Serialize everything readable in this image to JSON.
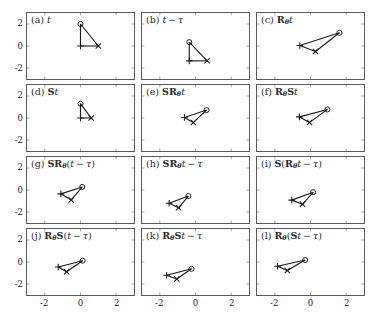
{
  "figure": {
    "type": "multi-panel-vector-diagram",
    "rows": 4,
    "cols": 3,
    "background": "#ffffff",
    "axis_color": "#5a5a5a",
    "line_color": "#1a1a1a"
  },
  "axes": {
    "xlim": [
      -3,
      3
    ],
    "ylim": [
      -3,
      3
    ],
    "xticks": [
      -2,
      0,
      2
    ],
    "yticks": [
      2,
      0,
      -2
    ],
    "xtick_labels": [
      "-2",
      "0",
      "2"
    ],
    "ytick_labels": [
      "2",
      "0",
      "-2"
    ],
    "grid": false
  },
  "markers": {
    "circle": "open-circle-marker",
    "plus": "plus-marker",
    "cross": "x-marker"
  },
  "chart_data": {
    "type": "scatter",
    "title": "",
    "xlabel": "",
    "ylabel": "",
    "xlim": [
      -3,
      3
    ],
    "ylim": [
      -3,
      3
    ],
    "xticks": [
      -2,
      0,
      2
    ],
    "yticks": [
      -2,
      0,
      2
    ],
    "grid": false,
    "panels": [
      {
        "tag": "(a)",
        "expr_parts": [
          {
            "t": "vec",
            "v": "t"
          }
        ],
        "expr_plain": "t⃗",
        "points": {
          "circle": [
            0.0,
            2.0
          ],
          "plus": [
            0.0,
            0.0
          ],
          "cross": [
            1.0,
            0.0
          ]
        },
        "edges": [
          [
            "circle",
            "plus"
          ],
          [
            "plus",
            "cross"
          ],
          [
            "cross",
            "circle"
          ]
        ]
      },
      {
        "tag": "(b)",
        "expr_parts": [
          {
            "t": "vec",
            "v": "t"
          },
          {
            "t": "op",
            "v": "−"
          },
          {
            "t": "vec",
            "v": "τ"
          }
        ],
        "expr_plain": "t⃗ − τ⃗",
        "points": {
          "circle": [
            -0.35,
            0.35
          ],
          "plus": [
            -0.35,
            -1.35
          ],
          "cross": [
            0.65,
            -1.35
          ]
        },
        "edges": [
          [
            "circle",
            "plus"
          ],
          [
            "plus",
            "cross"
          ],
          [
            "cross",
            "circle"
          ]
        ]
      },
      {
        "tag": "(c)",
        "expr_parts": [
          {
            "t": "bf",
            "v": "R"
          },
          {
            "t": "sub",
            "v": "θ"
          },
          {
            "t": "vec",
            "v": "t"
          }
        ],
        "expr_plain": "Rθ t⃗",
        "points": {
          "circle": [
            1.62,
            1.2
          ],
          "plus": [
            -0.6,
            0.05
          ],
          "cross": [
            0.28,
            -0.5
          ]
        },
        "edges": [
          [
            "circle",
            "plus"
          ],
          [
            "plus",
            "cross"
          ],
          [
            "cross",
            "circle"
          ]
        ]
      },
      {
        "tag": "(d)",
        "expr_parts": [
          {
            "t": "bf",
            "v": "S"
          },
          {
            "t": "vec",
            "v": "t"
          }
        ],
        "expr_plain": "S t⃗",
        "points": {
          "circle": [
            0.0,
            1.3
          ],
          "plus": [
            0.0,
            0.0
          ],
          "cross": [
            0.6,
            0.0
          ]
        },
        "edges": [
          [
            "circle",
            "plus"
          ],
          [
            "plus",
            "cross"
          ],
          [
            "cross",
            "circle"
          ]
        ]
      },
      {
        "tag": "(e)",
        "expr_parts": [
          {
            "t": "bf",
            "v": "SR"
          },
          {
            "t": "sub",
            "v": "θ"
          },
          {
            "t": "vec",
            "v": "t"
          }
        ],
        "expr_plain": "SRθ t⃗",
        "points": {
          "circle": [
            0.62,
            0.72
          ],
          "plus": [
            -0.62,
            0.05
          ],
          "cross": [
            -0.12,
            -0.4
          ]
        },
        "edges": [
          [
            "circle",
            "plus"
          ],
          [
            "plus",
            "cross"
          ],
          [
            "cross",
            "circle"
          ]
        ]
      },
      {
        "tag": "(f)",
        "expr_parts": [
          {
            "t": "bf",
            "v": "R"
          },
          {
            "t": "sub",
            "v": "θ"
          },
          {
            "t": "bf",
            "v": "S"
          },
          {
            "t": "vec",
            "v": "t"
          }
        ],
        "expr_plain": "Rθ S t⃗",
        "points": {
          "circle": [
            0.95,
            0.78
          ],
          "plus": [
            -0.62,
            0.1
          ],
          "cross": [
            -0.05,
            -0.4
          ]
        },
        "edges": [
          [
            "circle",
            "plus"
          ],
          [
            "plus",
            "cross"
          ],
          [
            "cross",
            "circle"
          ]
        ]
      },
      {
        "tag": "(g)",
        "expr_parts": [
          {
            "t": "bf",
            "v": "SR"
          },
          {
            "t": "sub",
            "v": "θ"
          },
          {
            "t": "op",
            "v": "("
          },
          {
            "t": "vec",
            "v": "t"
          },
          {
            "t": "op",
            "v": "−"
          },
          {
            "t": "vec",
            "v": "τ"
          },
          {
            "t": "op",
            "v": ")"
          }
        ],
        "expr_plain": "SRθ (t⃗ − τ⃗)",
        "points": {
          "circle": [
            0.1,
            0.28
          ],
          "plus": [
            -1.1,
            -0.35
          ],
          "cross": [
            -0.52,
            -0.9
          ]
        },
        "edges": [
          [
            "circle",
            "plus"
          ],
          [
            "plus",
            "cross"
          ],
          [
            "cross",
            "circle"
          ]
        ]
      },
      {
        "tag": "(h)",
        "expr_parts": [
          {
            "t": "bf",
            "v": "SR"
          },
          {
            "t": "sub",
            "v": "θ"
          },
          {
            "t": "vec",
            "v": "t"
          },
          {
            "t": "op",
            "v": "−"
          },
          {
            "t": "vec",
            "v": "τ"
          }
        ],
        "expr_plain": "SRθ t⃗ − τ⃗",
        "points": {
          "circle": [
            -0.4,
            -0.55
          ],
          "plus": [
            -1.48,
            -1.2
          ],
          "cross": [
            -0.95,
            -1.62
          ]
        },
        "edges": [
          [
            "circle",
            "plus"
          ],
          [
            "plus",
            "cross"
          ],
          [
            "cross",
            "circle"
          ]
        ]
      },
      {
        "tag": "(i)",
        "expr_parts": [
          {
            "t": "bf",
            "v": "S"
          },
          {
            "t": "op",
            "v": "("
          },
          {
            "t": "bf",
            "v": "R"
          },
          {
            "t": "sub",
            "v": "θ"
          },
          {
            "t": "vec",
            "v": "t"
          },
          {
            "t": "op",
            "v": "−"
          },
          {
            "t": "vec",
            "v": "τ"
          },
          {
            "t": "op",
            "v": ")"
          }
        ],
        "expr_plain": "S (Rθ t⃗ − τ⃗)",
        "points": {
          "circle": [
            0.15,
            -0.2
          ],
          "plus": [
            -1.05,
            -0.92
          ],
          "cross": [
            -0.45,
            -1.3
          ]
        },
        "edges": [
          [
            "circle",
            "plus"
          ],
          [
            "plus",
            "cross"
          ],
          [
            "cross",
            "circle"
          ]
        ]
      },
      {
        "tag": "(j)",
        "expr_parts": [
          {
            "t": "bf",
            "v": "R"
          },
          {
            "t": "sub",
            "v": "θ"
          },
          {
            "t": "bf",
            "v": "S"
          },
          {
            "t": "op",
            "v": "("
          },
          {
            "t": "vec",
            "v": "t"
          },
          {
            "t": "op",
            "v": "−"
          },
          {
            "t": "vec",
            "v": "τ"
          },
          {
            "t": "op",
            "v": ")"
          }
        ],
        "expr_plain": "Rθ S (t⃗ − τ⃗)",
        "points": {
          "circle": [
            0.12,
            0.12
          ],
          "plus": [
            -1.25,
            -0.45
          ],
          "cross": [
            -0.78,
            -0.88
          ]
        },
        "edges": [
          [
            "circle",
            "plus"
          ],
          [
            "plus",
            "cross"
          ],
          [
            "cross",
            "circle"
          ]
        ]
      },
      {
        "tag": "(k)",
        "expr_parts": [
          {
            "t": "bf",
            "v": "R"
          },
          {
            "t": "sub",
            "v": "θ"
          },
          {
            "t": "bf",
            "v": "S"
          },
          {
            "t": "vec",
            "v": "t"
          },
          {
            "t": "op",
            "v": "−"
          },
          {
            "t": "vec",
            "v": "τ"
          }
        ],
        "expr_plain": "Rθ S t⃗ − τ⃗",
        "points": {
          "circle": [
            -0.22,
            -0.62
          ],
          "plus": [
            -1.62,
            -1.2
          ],
          "cross": [
            -1.05,
            -1.55
          ]
        },
        "edges": [
          [
            "circle",
            "plus"
          ],
          [
            "plus",
            "cross"
          ],
          [
            "cross",
            "circle"
          ]
        ]
      },
      {
        "tag": "(l)",
        "expr_parts": [
          {
            "t": "bf",
            "v": "R"
          },
          {
            "t": "sub",
            "v": "θ"
          },
          {
            "t": "op",
            "v": "("
          },
          {
            "t": "bf",
            "v": "S"
          },
          {
            "t": "vec",
            "v": "t"
          },
          {
            "t": "op",
            "v": "−"
          },
          {
            "t": "vec",
            "v": "τ"
          },
          {
            "t": "op",
            "v": ")"
          }
        ],
        "expr_plain": "Rθ (S t⃗ − τ⃗)",
        "points": {
          "circle": [
            -0.3,
            0.18
          ],
          "plus": [
            -1.85,
            -0.38
          ],
          "cross": [
            -1.3,
            -0.78
          ]
        },
        "edges": [
          [
            "circle",
            "plus"
          ],
          [
            "plus",
            "cross"
          ],
          [
            "cross",
            "circle"
          ]
        ]
      }
    ]
  }
}
